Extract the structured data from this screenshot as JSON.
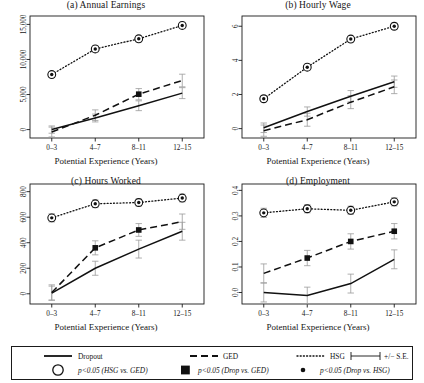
{
  "figure": {
    "xlabel": "Potential Experience (Years)",
    "categories": [
      "0–3",
      "4–7",
      "8–11",
      "12–15"
    ]
  },
  "legend": {
    "dropout_label": "Dropout",
    "ged_label": "GED",
    "hsg_label": "HSG",
    "se_label": "+/− S.E.",
    "sig_hsg_ged": "p<0.05 (HSG vs. GED)",
    "sig_drop_ged": "p<0.05 (Drop vs. GED)",
    "sig_drop_hsg": "p<0.05 (Drop vs. HSG)"
  },
  "chart_data": [
    {
      "type": "line",
      "panel": "a",
      "title": "(a) Annual Earnings",
      "xlabel": "Potential Experience (Years)",
      "ylabel": "",
      "x": [
        "0–3",
        "4–7",
        "8–11",
        "12–15"
      ],
      "ylim": [
        -1200,
        16200
      ],
      "yticks": [
        0,
        5000,
        10000,
        15000
      ],
      "yticklabels": [
        "0",
        "5,000",
        "10,000",
        "15,000"
      ],
      "grid": false,
      "series": [
        {
          "name": "Dropout",
          "style": "solid",
          "values": [
            0,
            1650,
            3400,
            5200
          ],
          "se": [
            520,
            560,
            700,
            780
          ],
          "sig_markers": [
            false,
            false,
            false,
            false
          ]
        },
        {
          "name": "GED",
          "style": "dashed",
          "values": [
            -350,
            2050,
            5050,
            7000
          ],
          "se": [
            700,
            760,
            800,
            900
          ],
          "sig_markers": [
            false,
            false,
            true,
            false
          ]
        },
        {
          "name": "HSG",
          "style": "dotted",
          "values": [
            7850,
            11500,
            12950,
            14850
          ],
          "se": [
            420,
            430,
            430,
            450
          ],
          "sig_markers": [
            true,
            true,
            true,
            true
          ]
        }
      ]
    },
    {
      "type": "line",
      "panel": "b",
      "title": "(b) Hourly Wage",
      "xlabel": "Potential Experience (Years)",
      "ylabel": "",
      "x": [
        "0–3",
        "4–7",
        "8–11",
        "12–15"
      ],
      "ylim": [
        -0.55,
        6.6
      ],
      "yticks": [
        0,
        2,
        4,
        6
      ],
      "yticklabels": [
        "0",
        "2",
        "4",
        "6"
      ],
      "grid": false,
      "series": [
        {
          "name": "Dropout",
          "style": "solid",
          "values": [
            0.05,
            1.0,
            1.9,
            2.75
          ],
          "se": [
            0.28,
            0.27,
            0.33,
            0.33
          ],
          "sig_markers": [
            false,
            false,
            false,
            false
          ]
        },
        {
          "name": "GED",
          "style": "dashed",
          "values": [
            -0.12,
            0.52,
            1.55,
            2.45
          ],
          "se": [
            0.33,
            0.38,
            0.38,
            0.4
          ],
          "sig_markers": [
            false,
            false,
            false,
            false
          ]
        },
        {
          "name": "HSG",
          "style": "dotted",
          "values": [
            1.75,
            3.6,
            5.25,
            6.0
          ],
          "se": [
            0.17,
            0.17,
            0.17,
            0.18
          ],
          "sig_markers": [
            true,
            true,
            true,
            true
          ]
        }
      ]
    },
    {
      "type": "line",
      "panel": "c",
      "title": "(c) Hours Worked",
      "xlabel": "Potential Experience (Years)",
      "ylabel": "",
      "x": [
        "0–3",
        "4–7",
        "8–11",
        "12–15"
      ],
      "ylim": [
        -80,
        860
      ],
      "yticks": [
        0,
        200,
        400,
        600,
        800
      ],
      "yticklabels": [
        "0",
        "200",
        "400",
        "600",
        "800"
      ],
      "grid": false,
      "series": [
        {
          "name": "Dropout",
          "style": "solid",
          "values": [
            5,
            200,
            350,
            490
          ],
          "se": [
            55,
            55,
            70,
            70
          ],
          "sig_markers": [
            false,
            false,
            false,
            false
          ]
        },
        {
          "name": "GED",
          "style": "dashed",
          "values": [
            10,
            360,
            500,
            565
          ],
          "se": [
            60,
            55,
            50,
            60
          ],
          "sig_markers": [
            false,
            true,
            true,
            false
          ]
        },
        {
          "name": "HSG",
          "style": "dotted",
          "values": [
            595,
            705,
            715,
            750
          ],
          "se": [
            32,
            30,
            28,
            30
          ],
          "sig_markers": [
            true,
            true,
            true,
            true
          ]
        }
      ]
    },
    {
      "type": "line",
      "panel": "d",
      "title": "(d) Employment",
      "xlabel": "Potential Experience (Years)",
      "ylabel": "",
      "x": [
        "0–3",
        "4–7",
        "8–11",
        "12–15"
      ],
      "ylim": [
        -0.045,
        0.425
      ],
      "yticks": [
        0.0,
        0.1,
        0.2,
        0.3,
        0.4
      ],
      "yticklabels": [
        "0.0",
        "0.1",
        "0.2",
        "0.3",
        "0.4"
      ],
      "grid": false,
      "series": [
        {
          "name": "Dropout",
          "style": "solid",
          "values": [
            0.0,
            -0.012,
            0.035,
            0.13
          ],
          "se": [
            0.037,
            0.033,
            0.037,
            0.037
          ],
          "sig_markers": [
            false,
            false,
            false,
            false
          ]
        },
        {
          "name": "GED",
          "style": "dashed",
          "values": [
            0.075,
            0.135,
            0.2,
            0.24
          ],
          "se": [
            0.037,
            0.03,
            0.03,
            0.03
          ],
          "sig_markers": [
            false,
            true,
            true,
            true
          ]
        },
        {
          "name": "HSG",
          "style": "dotted",
          "values": [
            0.312,
            0.328,
            0.322,
            0.355
          ],
          "se": [
            0.018,
            0.016,
            0.016,
            0.016
          ],
          "sig_markers": [
            true,
            true,
            true,
            true
          ]
        }
      ]
    }
  ]
}
